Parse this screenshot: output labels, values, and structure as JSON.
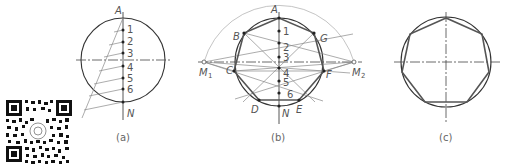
{
  "figure_a": {
    "caption": "(a)",
    "top_label": "A",
    "bottom_label": "N",
    "division_labels": [
      "1",
      "2",
      "3",
      "4",
      "5",
      "6"
    ]
  },
  "figure_b": {
    "caption": "(b)",
    "vertex_labels": [
      "A",
      "B",
      "C",
      "D",
      "E",
      "F",
      "G"
    ],
    "bottom_label": "N",
    "left_focus_label": "M",
    "left_focus_sub": "1",
    "right_focus_label": "M",
    "right_focus_sub": "2",
    "division_labels": [
      "1",
      "2",
      "3",
      "4",
      "5",
      "6"
    ]
  },
  "figure_c": {
    "caption": "(c)"
  },
  "qr_code": {
    "icon": "qr-code-icon"
  }
}
